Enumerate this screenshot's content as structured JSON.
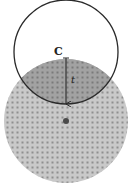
{
  "diagram": {
    "labels": {
      "center_point": "C",
      "radius": "t"
    },
    "colors": {
      "outline_circle": "#2a2a2a",
      "disk_fill": "#c9c9c9",
      "disk_dots": "#8f8f8f",
      "overlap_fill": "#9a9a9a",
      "arrow": "#2a2a2a",
      "center_dot": "#4a4a4a"
    }
  }
}
